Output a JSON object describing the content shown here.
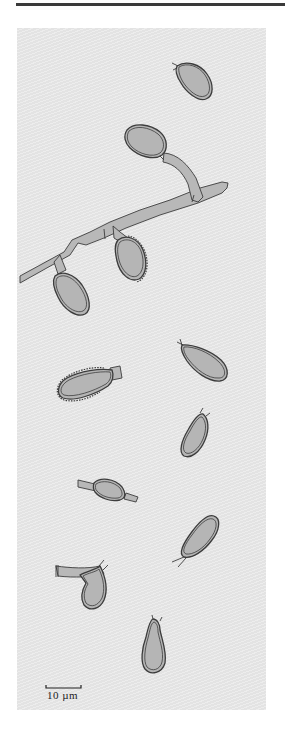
{
  "figure": {
    "type": "scientific-illustration",
    "scale_bar": {
      "label": "10 µm",
      "length_px": 35
    },
    "colors": {
      "panel_background": "#e3e3e3",
      "spore_fill": "#b5b5b5",
      "outline": "#3c3c3c",
      "top_rule": "#3a3a3a"
    },
    "elements": [
      {
        "name": "spore-1",
        "description": "free ovoid spore, top right"
      },
      {
        "name": "hypha-branch",
        "description": "main hypha diagonal with side branch bearing spore"
      },
      {
        "name": "spore-attached-2",
        "description": "spore attached to hypha with warty wall"
      },
      {
        "name": "spore-attached-3",
        "description": "spore attached near left of hypha"
      },
      {
        "name": "spore-4",
        "description": "free pyriform spore, right"
      },
      {
        "name": "spore-5",
        "description": "spore with warty outline, left"
      },
      {
        "name": "spore-6",
        "description": "small pyriform spore, right"
      },
      {
        "name": "spore-7",
        "description": "intercalary swelling on hyphal segment"
      },
      {
        "name": "spore-8",
        "description": "elongate spore with stalk, right"
      },
      {
        "name": "spore-9",
        "description": "lateral spore on bent hypha, left"
      },
      {
        "name": "spore-10",
        "description": "clavate spore, bottom"
      }
    ]
  }
}
